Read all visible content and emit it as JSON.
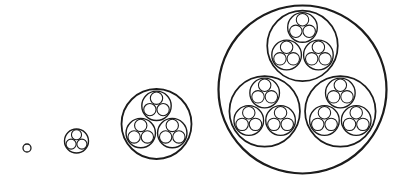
{
  "diagram": {
    "stroke_color": "#1c1c1c",
    "background": "#ffffff",
    "child_radius_ratio": 0.42,
    "child_offset_ratio": 0.52,
    "stages": [
      {
        "level": 0,
        "cx": 27,
        "cy": 148,
        "r": 4,
        "stroke_width": 1.3
      },
      {
        "level": 1,
        "cx": 76.5,
        "cy": 141,
        "r": 12,
        "stroke_width": 1.4
      },
      {
        "level": 2,
        "cx": 156.5,
        "cy": 124,
        "r": 35,
        "stroke_width": 1.8
      },
      {
        "level": 3,
        "cx": 302.5,
        "cy": 89.5,
        "r": 84,
        "stroke_width": 2.2
      }
    ]
  }
}
